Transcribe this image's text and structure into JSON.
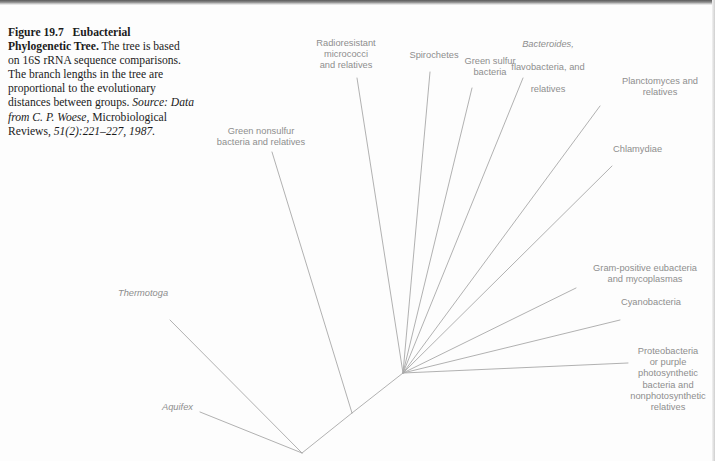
{
  "figure": {
    "caption": {
      "number": "Figure 19.7",
      "title": "Eubacterial Phylogenetic Tree.",
      "body": " The tree is based on 16S rRNA sequence comparisons. The branch lengths in the tree are proportional to the evolutionary distances between groups. ",
      "source_label": "Source:",
      "source_text": " Data from C. P. Woese,",
      "source_journal": " Microbiological Reviews,",
      "source_citation": " 51(2):221–227, 1987."
    }
  },
  "tree": {
    "type": "unrooted-phylogram",
    "line_color": "#a8a8a8",
    "label_color": "#8e8e8e",
    "nodes": {
      "radiation_node": [
        403,
        373
      ],
      "mid_node": [
        352,
        413
      ],
      "base_node": [
        302,
        453
      ]
    },
    "leaves": [
      {
        "id": "thermotoga",
        "label": "Thermotoga",
        "italic": true,
        "label_x": 118,
        "label_y": 288,
        "align": "left",
        "branch": [
          [
            170,
            320
          ],
          [
            302,
            453
          ]
        ]
      },
      {
        "id": "aquifex",
        "label": "Aquifex",
        "italic": true,
        "label_x": 162,
        "label_y": 402,
        "align": "left",
        "branch": [
          [
            200,
            412
          ],
          [
            302,
            453
          ]
        ]
      },
      {
        "id": "green-nonsulfur",
        "label": "Green nonsulfur\nbacteria and relatives",
        "italic": false,
        "label_x": 206,
        "label_y": 126,
        "align": "center",
        "branch": [
          [
            272,
            152
          ],
          [
            352,
            413
          ]
        ]
      },
      {
        "id": "radioresistant",
        "label": "Radioresistant\nmicrococci\nand relatives",
        "italic": false,
        "label_x": 311,
        "label_y": 38,
        "align": "center",
        "branch": [
          [
            357,
            78
          ],
          [
            403,
            373
          ]
        ]
      },
      {
        "id": "spirochetes",
        "label": "Spirochetes",
        "italic": false,
        "label_x": 408,
        "label_y": 50,
        "align": "center",
        "branch": [
          [
            430,
            72
          ],
          [
            403,
            373
          ]
        ]
      },
      {
        "id": "green-sulfur",
        "label": "Green sulfur\nbacteria",
        "italic": false,
        "label_x": 462,
        "label_y": 56,
        "align": "center",
        "branch": [
          [
            472,
            88
          ],
          [
            403,
            373
          ]
        ]
      },
      {
        "id": "bacteroides",
        "label": "Bacteroides,\nflavobacteria, and\nrelatives",
        "italic_first_line": true,
        "label_x": 498,
        "label_y": 28,
        "align": "center",
        "branch": [
          [
            523,
            78
          ],
          [
            403,
            373
          ]
        ]
      },
      {
        "id": "planctomyces",
        "label": "Planctomyces and\nrelatives",
        "italic": false,
        "label_x": 607,
        "label_y": 76,
        "align": "left",
        "branch": [
          [
            600,
            106
          ],
          [
            403,
            373
          ]
        ]
      },
      {
        "id": "chlamydiae",
        "label": "Chlamydiae",
        "italic": false,
        "label_x": 613,
        "label_y": 144,
        "align": "left",
        "branch": [
          [
            612,
            166
          ],
          [
            403,
            373
          ]
        ]
      },
      {
        "id": "gram-positive",
        "label": "Gram-positive eubacteria\nand mycoplasmas",
        "italic": false,
        "label_x": 578,
        "label_y": 263,
        "align": "left",
        "branch": [
          [
            576,
            288
          ],
          [
            403,
            373
          ]
        ]
      },
      {
        "id": "cyanobacteria",
        "label": "Cyanobacteria",
        "italic": false,
        "label_x": 621,
        "label_y": 297,
        "align": "left",
        "branch": [
          [
            620,
            320
          ],
          [
            403,
            373
          ]
        ]
      },
      {
        "id": "proteobacteria",
        "label": "Proteobacteria\nor purple\nphotosynthetic\nbacteria and\nnonphotosynthetic\nrelatives",
        "italic": false,
        "label_x": 628,
        "label_y": 346,
        "align": "center",
        "branch": [
          [
            628,
            363
          ],
          [
            403,
            373
          ]
        ]
      }
    ]
  }
}
